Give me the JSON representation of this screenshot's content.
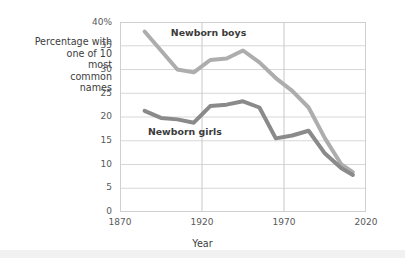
{
  "chart_data": {
    "type": "line",
    "title": "",
    "xlabel": "Year",
    "ylabel": "Percentage with\none of 10\nmost\ncommon\nnames",
    "xlim": [
      1870,
      2020
    ],
    "ylim": [
      0,
      40
    ],
    "xticks": [
      "1870",
      "1920",
      "1970",
      "2020"
    ],
    "xtick_values": [
      1870,
      1920,
      1970,
      2020
    ],
    "yticks": [
      "0",
      "5",
      "10",
      "15",
      "20",
      "25",
      "30",
      "35",
      "40%"
    ],
    "ytick_values": [
      0,
      5,
      10,
      15,
      20,
      25,
      30,
      35,
      40
    ],
    "grid": "horizontal-and-vertical",
    "legend_position": "inline-annotations",
    "series": [
      {
        "name": "Newborn boys",
        "color": "#adadad",
        "label_x": 1901,
        "label_y": 38.0,
        "x": [
          1885,
          1895,
          1905,
          1915,
          1925,
          1935,
          1945,
          1955,
          1965,
          1975,
          1985,
          1995,
          2005,
          2012
        ],
        "values": [
          38.0,
          34.0,
          30.0,
          29.4,
          32.0,
          32.3,
          34.0,
          31.5,
          28.2,
          25.5,
          22.0,
          15.5,
          10.0,
          8.4
        ]
      },
      {
        "name": "Newborn girls",
        "color": "#8a8a8a",
        "label_x": 1887,
        "label_y": 17.0,
        "x": [
          1885,
          1895,
          1905,
          1915,
          1925,
          1935,
          1945,
          1955,
          1965,
          1975,
          1985,
          1995,
          2005,
          2012
        ],
        "values": [
          21.3,
          19.8,
          19.5,
          18.8,
          22.3,
          22.6,
          23.3,
          22.0,
          15.5,
          16.1,
          17.1,
          12.3,
          9.2,
          7.8
        ]
      }
    ]
  },
  "axis": {
    "y_title": "Percentage with\none of 10\nmost\ncommon\nnames",
    "x_title": "Year",
    "ytick_labels": [
      "40%",
      "35",
      "30",
      "25",
      "20",
      "15",
      "10",
      "5",
      "0"
    ],
    "xtick_labels": [
      "1870",
      "1920",
      "1970",
      "2020"
    ]
  }
}
